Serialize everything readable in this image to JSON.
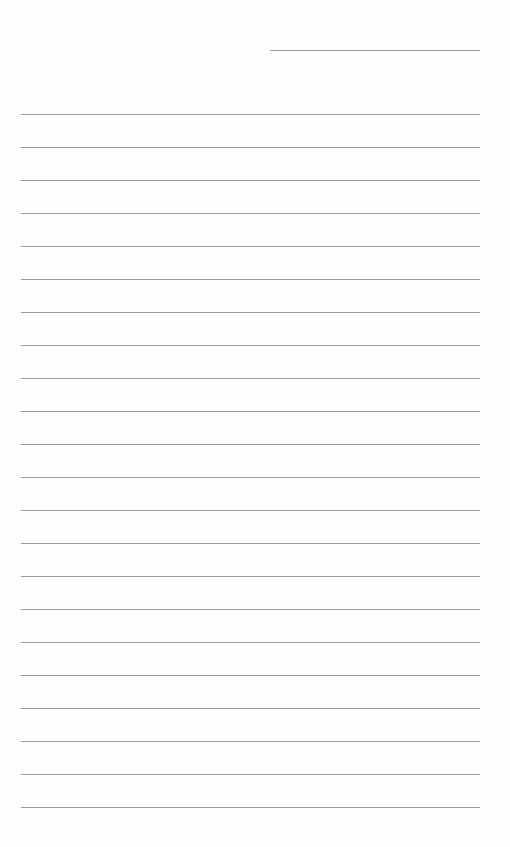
{
  "page": {
    "type": "lined-paper",
    "background_color": "#ffffff",
    "line_color": "#9c9c9c",
    "header_line": {
      "text": ""
    },
    "line_count": 22,
    "line_spacing_px": 33,
    "lines": [
      "",
      "",
      "",
      "",
      "",
      "",
      "",
      "",
      "",
      "",
      "",
      "",
      "",
      "",
      "",
      "",
      "",
      "",
      "",
      "",
      "",
      ""
    ]
  }
}
